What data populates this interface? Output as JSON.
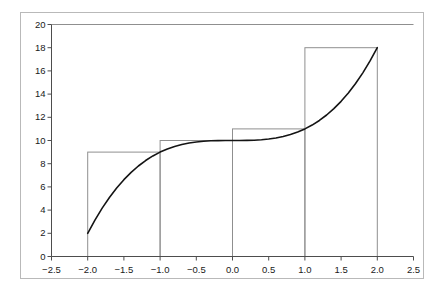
{
  "chart_data": {
    "type": "area",
    "title": "",
    "subtitle": "",
    "xlabel": "",
    "ylabel": "",
    "xlim": [
      -2.5,
      2.5
    ],
    "ylim": [
      0,
      20
    ],
    "grid": false,
    "legend": null,
    "x_ticks": [
      -2.5,
      -2.0,
      -1.5,
      -1.0,
      -0.5,
      0.0,
      0.5,
      1.0,
      1.5,
      2.0,
      2.5
    ],
    "x_tick_labels": [
      "−2.5",
      "−2.0",
      "−1.5",
      "−1.0",
      "−0.5",
      "0.0",
      "0.5",
      "1.0",
      "1.5",
      "2.0",
      "2.5"
    ],
    "y_ticks": [
      0,
      2,
      4,
      6,
      8,
      10,
      12,
      14,
      16,
      18,
      20
    ],
    "y_tick_labels": [
      "0",
      "2",
      "4",
      "6",
      "8",
      "10",
      "12",
      "14",
      "16",
      "18",
      "20"
    ],
    "series": [
      {
        "name": "curve",
        "type": "line",
        "function": "x^3 + 10",
        "color": "#141414",
        "line_width": 1.6,
        "x_range": [
          -2,
          2
        ],
        "points": [
          [
            -2.0,
            2.0
          ],
          [
            -1.9,
            3.141
          ],
          [
            -1.8,
            4.168
          ],
          [
            -1.7,
            5.087
          ],
          [
            -1.6,
            5.904
          ],
          [
            -1.5,
            6.625
          ],
          [
            -1.4,
            7.256
          ],
          [
            -1.3,
            7.803
          ],
          [
            -1.2,
            8.272
          ],
          [
            -1.1,
            8.669
          ],
          [
            -1.0,
            9.0
          ],
          [
            -0.9,
            9.271
          ],
          [
            -0.8,
            9.488
          ],
          [
            -0.7,
            9.657
          ],
          [
            -0.6,
            9.784
          ],
          [
            -0.5,
            9.875
          ],
          [
            -0.4,
            9.936
          ],
          [
            -0.3,
            9.973
          ],
          [
            -0.2,
            9.992
          ],
          [
            -0.1,
            9.999
          ],
          [
            0.0,
            10.0
          ],
          [
            0.1,
            10.001
          ],
          [
            0.2,
            10.008
          ],
          [
            0.3,
            10.027
          ],
          [
            0.4,
            10.064
          ],
          [
            0.5,
            10.125
          ],
          [
            0.6,
            10.216
          ],
          [
            0.7,
            10.343
          ],
          [
            0.8,
            10.512
          ],
          [
            0.9,
            10.729
          ],
          [
            1.0,
            11.0
          ],
          [
            1.1,
            11.331
          ],
          [
            1.2,
            11.728
          ],
          [
            1.3,
            12.197
          ],
          [
            1.4,
            12.744
          ],
          [
            1.5,
            13.375
          ],
          [
            1.6,
            14.096
          ],
          [
            1.7,
            14.913
          ],
          [
            1.8,
            15.832
          ],
          [
            1.9,
            16.859
          ],
          [
            2.0,
            18.0
          ]
        ]
      },
      {
        "name": "riemann-rectangles",
        "type": "bar",
        "edge_color": "#8f8f8f",
        "fill": "none",
        "bar_width": 1,
        "categories": [
          "[-2,-1]",
          "[-1,0]",
          "[0,1]",
          "[1,2]"
        ],
        "left_edges": [
          -2,
          -1,
          0,
          1
        ],
        "right_edges": [
          -1,
          0,
          1,
          2
        ],
        "values": [
          9,
          10,
          11,
          18
        ],
        "sample_rule": "right-endpoint"
      }
    ]
  },
  "axes": {
    "axis_color": "#4d4d4d",
    "top_line_color": "#8f8f8f",
    "frame_color": "#b9b9b9",
    "background": "#ffffff"
  }
}
